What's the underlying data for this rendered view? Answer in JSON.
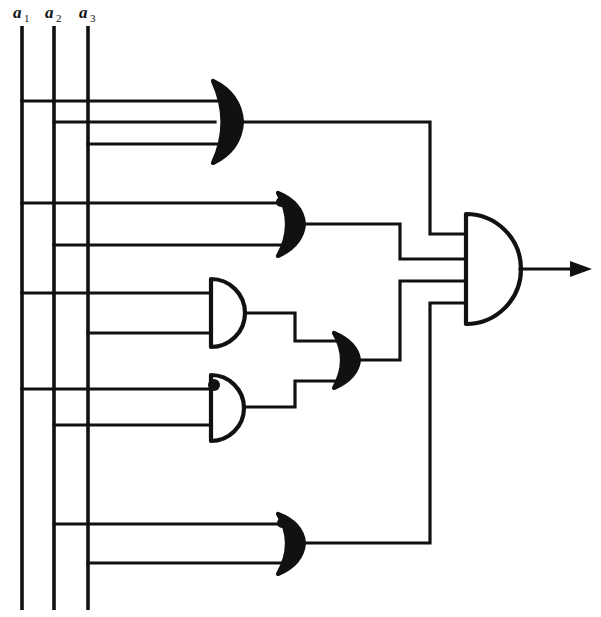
{
  "diagram": {
    "type": "logic-circuit-schematic",
    "width": 601,
    "height": 617,
    "background_color": "#ffffff",
    "line_color": "#111111"
  },
  "inputs": [
    {
      "id": "a1",
      "base": "a",
      "subscript": "1",
      "label": "a₁",
      "x": 22,
      "label_x": 14,
      "label_y": 16,
      "top_y": 26,
      "bottom_y": 610
    },
    {
      "id": "a2",
      "base": "a",
      "subscript": "2",
      "label": "a₂",
      "x": 54,
      "label_x": 46,
      "label_y": 16,
      "top_y": 26,
      "bottom_y": 610
    },
    {
      "id": "a3",
      "base": "a",
      "subscript": "3",
      "label": "a₃",
      "x": 88,
      "label_x": 80,
      "label_y": 16,
      "top_y": 26,
      "bottom_y": 610
    }
  ],
  "gates": [
    {
      "id": "or1",
      "name": "or-gate-1",
      "kind": "OR",
      "inputs_count": 3,
      "x": 213,
      "y": 120,
      "width": 38,
      "height": 82,
      "input_wire_y": [
        101,
        122,
        144
      ],
      "source_inputs": [
        "a1",
        "a2",
        "a3"
      ],
      "output_y": 122,
      "has_input_dot": false
    },
    {
      "id": "or2",
      "name": "or-gate-2",
      "kind": "OR",
      "inputs_count": 2,
      "x": 278,
      "y": 224,
      "width": 34,
      "height": 64,
      "input_wire_y": [
        203,
        245
      ],
      "source_inputs": [
        "a1",
        "a2"
      ],
      "output_y": 224,
      "has_input_dot": true
    },
    {
      "id": "and1",
      "name": "and-gate-1",
      "kind": "AND",
      "inputs_count": 2,
      "x": 210,
      "y": 313,
      "width": 40,
      "height": 68,
      "input_wire_y": [
        293,
        333
      ],
      "source_inputs": [
        "a1",
        "a3"
      ],
      "output_y": 313,
      "has_input_dot": false
    },
    {
      "id": "and2",
      "name": "and-gate-2",
      "kind": "AND",
      "inputs_count": 2,
      "x": 210,
      "y": 407,
      "width": 40,
      "height": 68,
      "input_wire_y": [
        389,
        425
      ],
      "source_inputs": [
        "a1",
        "a2"
      ],
      "output_y": 407,
      "has_input_dot": true
    },
    {
      "id": "or3",
      "name": "or-gate-3",
      "kind": "OR",
      "inputs_count": 2,
      "x": 334,
      "y": 360,
      "width": 30,
      "height": 56,
      "input_wire_y": [
        341,
        381
      ],
      "source_inputs": [
        "and1",
        "and2"
      ],
      "output_y": 360,
      "has_input_dot": false
    },
    {
      "id": "or4",
      "name": "or-gate-4",
      "kind": "OR",
      "inputs_count": 2,
      "x": 278,
      "y": 543,
      "width": 34,
      "height": 62,
      "input_wire_y": [
        524,
        563
      ],
      "source_inputs": [
        "a2",
        "a3"
      ],
      "output_y": 543,
      "has_input_dot": true
    },
    {
      "id": "and-final",
      "name": "and-gate-output",
      "kind": "AND",
      "inputs_count": 4,
      "x": 465,
      "y": 269,
      "width": 56,
      "height": 110,
      "input_wire_y": [
        234,
        259,
        281,
        303
      ],
      "source_inputs": [
        "or1",
        "or2",
        "or3",
        "or4"
      ],
      "output_y": 269,
      "has_input_dot": false
    }
  ],
  "output": {
    "name": "circuit-output",
    "label": "",
    "wire_y": 269,
    "x_start": 521,
    "x_end": 590,
    "arrow": true
  },
  "icons": {
    "or_gate": "or-gate-icon",
    "and_gate": "and-gate-icon",
    "junction": "junction-dot-icon",
    "arrow": "arrow-head-icon"
  },
  "colors": {
    "line": "#111111",
    "background": "#ffffff",
    "gate_fill": "#ffffff"
  }
}
